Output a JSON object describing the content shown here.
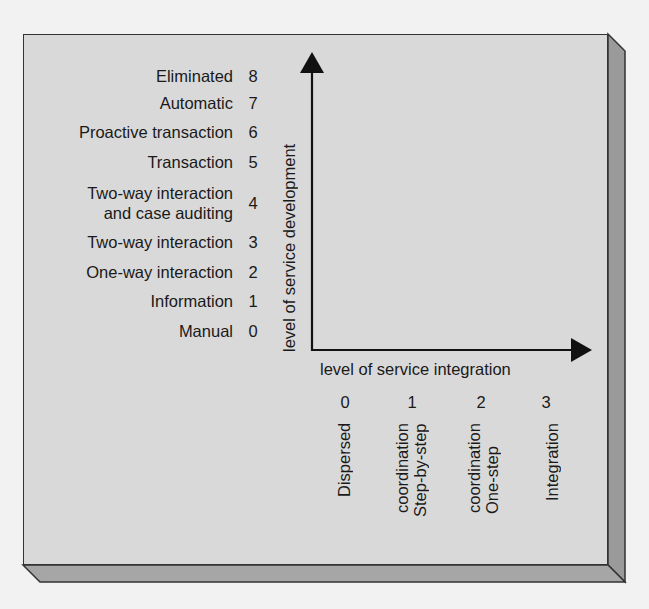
{
  "colors": {
    "page_background": "#f2f2f2",
    "panel_face": "#d9d9d9",
    "panel_side": "#9a9a9a",
    "panel_bottom": "#a6a6a6",
    "outline": "#333333",
    "axis": "#111111",
    "text": "#1a1a1a"
  },
  "diagram": {
    "y_axis": {
      "title": "level of service development",
      "levels": [
        {
          "value": "8",
          "label": "Eliminated"
        },
        {
          "value": "7",
          "label": "Automatic"
        },
        {
          "value": "6",
          "label": "Proactive transaction"
        },
        {
          "value": "5",
          "label": "Transaction"
        },
        {
          "value": "4",
          "label_line1": "Two-way interaction",
          "label_line2": "and case auditing"
        },
        {
          "value": "3",
          "label": "Two-way interaction"
        },
        {
          "value": "2",
          "label": "One-way interaction"
        },
        {
          "value": "1",
          "label": "Information"
        },
        {
          "value": "0",
          "label": "Manual"
        }
      ]
    },
    "x_axis": {
      "title": "level of service integration",
      "levels": [
        {
          "value": "0",
          "label": "Dispersed"
        },
        {
          "value": "1",
          "label_line1": "Step-by-step",
          "label_line2": "coordination"
        },
        {
          "value": "2",
          "label_line1": "One-step",
          "label_line2": "coordination"
        },
        {
          "value": "3",
          "label": "Integration"
        }
      ]
    }
  }
}
